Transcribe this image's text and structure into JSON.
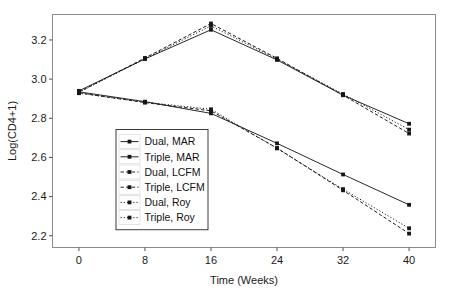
{
  "chart_data": {
    "type": "line",
    "title": "",
    "xlabel": "Time (Weeks)",
    "ylabel": "Log(CD4+1)",
    "x": [
      0,
      8,
      16,
      24,
      32,
      40
    ],
    "xticklabels": [
      "0",
      "8",
      "16",
      "24",
      "32",
      "40"
    ],
    "yticklabels": [
      "2.2",
      "2.4",
      "2.6",
      "2.8",
      "3.0",
      "3.2"
    ],
    "yticks": [
      2.2,
      2.4,
      2.6,
      2.8,
      3.0,
      3.2
    ],
    "xlim": [
      -3.2,
      43.2
    ],
    "ylim": [
      2.14,
      3.33
    ],
    "grid": false,
    "legend_position": "center-left-inside",
    "series": [
      {
        "name": "Dual, MAR",
        "values": [
          2.935,
          2.885,
          2.825,
          2.672,
          2.513,
          2.358
        ],
        "dash": "none",
        "marker": "square"
      },
      {
        "name": "Triple, MAR",
        "values": [
          2.94,
          3.103,
          3.252,
          3.098,
          2.918,
          2.772
        ],
        "dash": "none",
        "marker": "square"
      },
      {
        "name": "Dual, LCFM",
        "values": [
          2.93,
          2.88,
          2.838,
          2.648,
          2.432,
          2.211
        ],
        "dash": "dash",
        "marker": "square"
      },
      {
        "name": "Triple, LCFM",
        "values": [
          2.934,
          3.108,
          3.284,
          3.106,
          2.918,
          2.722
        ],
        "dash": "dash",
        "marker": "square"
      },
      {
        "name": "Dual, Roy",
        "values": [
          2.928,
          2.882,
          2.846,
          2.646,
          2.438,
          2.238
        ],
        "dash": "dot",
        "marker": "square"
      },
      {
        "name": "Triple, Roy",
        "values": [
          2.932,
          3.104,
          3.272,
          3.102,
          2.924,
          2.742
        ],
        "dash": "dot",
        "marker": "square"
      }
    ],
    "colors": {
      "line": "#1c1c1c",
      "marker": "#161616",
      "frame": "#8c8c8c",
      "text": "#1a1a1a",
      "background": "#ffffff"
    }
  }
}
